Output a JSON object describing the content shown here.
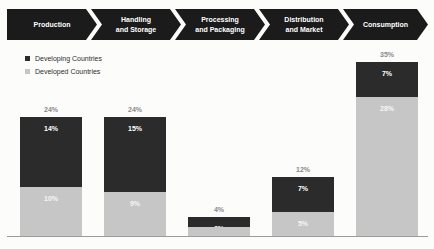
{
  "flow": {
    "stages": [
      {
        "label": "Production"
      },
      {
        "label": "Handling\nand Storage"
      },
      {
        "label": "Processing\nand Packaging"
      },
      {
        "label": "Distribution\nand Market"
      },
      {
        "label": "Consumption"
      }
    ]
  },
  "legend": {
    "items": [
      {
        "label": "Developing Countries",
        "color": "#2b2b2b"
      },
      {
        "label": "Developed Countries",
        "color": "#c6c6c6"
      }
    ]
  },
  "bars": [
    {
      "total": "24%",
      "developing": "14%",
      "developed": "10%"
    },
    {
      "total": "24%",
      "developing": "15%",
      "developed": "9%"
    },
    {
      "total": "4%",
      "developing": "2%",
      "developed": "2%"
    },
    {
      "total": "12%",
      "developing": "7%",
      "developed": "5%"
    },
    {
      "total": "35%",
      "developing": "7%",
      "developed": "28%"
    }
  ],
  "chart_data": {
    "type": "bar",
    "stacked": true,
    "categories": [
      "Production",
      "Handling and Storage",
      "Processing and Packaging",
      "Distribution and Market",
      "Consumption"
    ],
    "series": [
      {
        "name": "Developing Countries",
        "color": "#2b2b2b",
        "position": "top",
        "values": [
          14,
          15,
          2,
          7,
          7
        ]
      },
      {
        "name": "Developed Countries",
        "color": "#c6c6c6",
        "position": "bottom",
        "values": [
          10,
          9,
          2,
          5,
          28
        ]
      }
    ],
    "totals": [
      24,
      24,
      4,
      12,
      35
    ],
    "value_suffix": "%",
    "title": "",
    "xlabel": "",
    "ylabel": "",
    "ylim": [
      0,
      35
    ],
    "grid": false,
    "legend_position": "top-left",
    "pixels_per_percent": 5
  },
  "colors": {
    "arrow_bg": "#1b1b1b",
    "dark_segment": "#2b2b2b",
    "light_segment": "#c6c6c6",
    "total_label": "#8a8a8a",
    "baseline": "#9b9b9b"
  }
}
